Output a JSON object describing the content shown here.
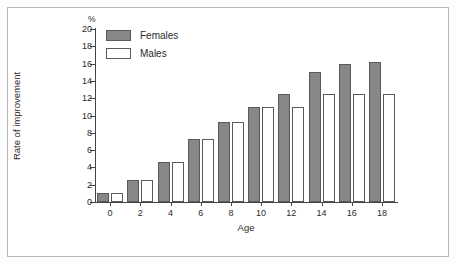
{
  "chart_data": {
    "type": "bar",
    "title": "",
    "xlabel": "Age",
    "ylabel": "Rate of improvement",
    "yunit": "%",
    "categories": [
      "0",
      "2",
      "4",
      "6",
      "8",
      "10",
      "12",
      "14",
      "16",
      "18"
    ],
    "series": [
      {
        "name": "Females",
        "color": "#878787",
        "values": [
          1.0,
          2.6,
          4.6,
          7.3,
          9.2,
          11.0,
          12.5,
          15.0,
          16.0,
          16.2
        ]
      },
      {
        "name": "Males",
        "color": "#ffffff",
        "values": [
          1.0,
          2.6,
          4.6,
          7.3,
          9.2,
          11.0,
          11.0,
          12.5,
          12.5,
          12.5
        ]
      }
    ],
    "ylim": [
      0,
      20
    ],
    "yticks": [
      "0",
      "2",
      "4",
      "6",
      "8",
      "10",
      "12",
      "14",
      "16",
      "18",
      "20"
    ],
    "grid": false,
    "legend_position": "top-left"
  }
}
